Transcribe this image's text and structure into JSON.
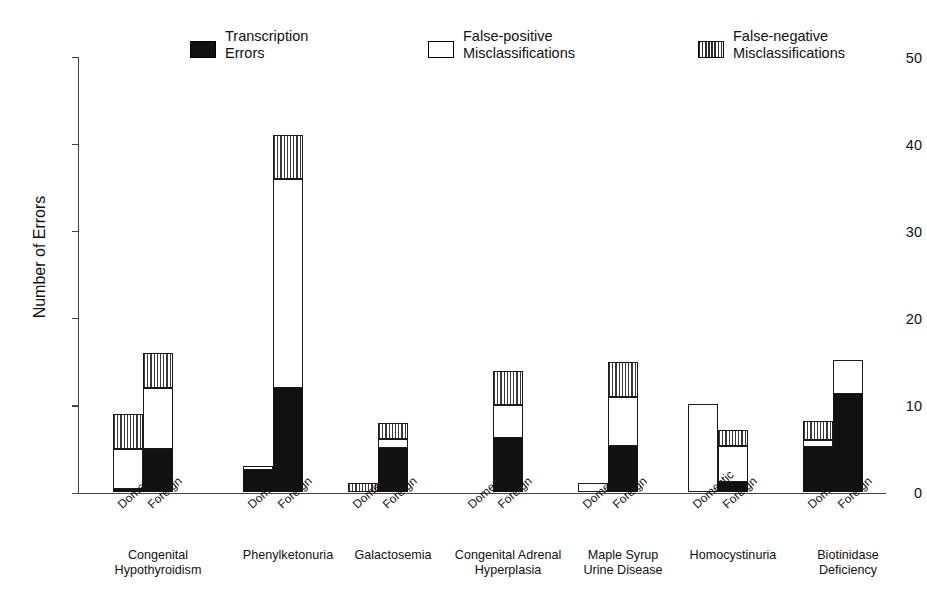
{
  "chart_data": {
    "type": "bar",
    "title": "",
    "xlabel": "",
    "ylabel": "Number of Errors",
    "ylim": [
      0,
      50
    ],
    "yticks": [
      0,
      10,
      20,
      30,
      40,
      50
    ],
    "grid": false,
    "stacked": true,
    "legend_position": "top",
    "categories": [
      "Congenital\nHypothyroidism",
      "Phenylketonuria",
      "Galactosemia",
      "Congenital Adrenal\nHyperplasia",
      "Maple Syrup\nUrine Disease",
      "Homocystinuria",
      "Biotinidase\nDeficiency"
    ],
    "subcategories": [
      "Domestic",
      "Foreign"
    ],
    "series": [
      {
        "name": "Transcription Errors",
        "fill": "black",
        "values": {
          "Domestic": [
            0.4,
            2.6,
            0,
            0,
            0,
            0,
            5.2
          ],
          "Foreign": [
            5.0,
            12.0,
            5.1,
            6.3,
            5.3,
            1.2,
            11.3
          ]
        }
      },
      {
        "name": "False-positive Misclassifications",
        "fill": "white",
        "values": {
          "Domestic": [
            4.6,
            0.5,
            0,
            0,
            1.1,
            10.2,
            0.8
          ],
          "Foreign": [
            7.0,
            24.0,
            1.0,
            3.7,
            5.7,
            4.1,
            3.9
          ]
        }
      },
      {
        "name": "False-negative Misclassifications",
        "fill": "hatch",
        "values": {
          "Domestic": [
            4.0,
            0,
            1.1,
            0,
            0,
            0,
            2.2
          ],
          "Foreign": [
            4.0,
            5.0,
            1.9,
            4.0,
            4.0,
            1.9,
            0
          ]
        }
      }
    ],
    "totals": {
      "Domestic": [
        9.0,
        3.1,
        1.1,
        0,
        1.1,
        10.2,
        8.2
      ],
      "Foreign": [
        16.0,
        41.0,
        8.0,
        14.0,
        15.0,
        7.2,
        15.2
      ]
    }
  },
  "legend": {
    "items": [
      {
        "label": "Transcription\nErrors",
        "swatch": "black"
      },
      {
        "label": "False-positive\nMisclassifications",
        "swatch": "white"
      },
      {
        "label": "False-negative\nMisclassifications",
        "swatch": "hatch"
      }
    ]
  },
  "axis": {
    "y_title": "Number of Errors",
    "y_tick_labels": [
      "50",
      "40",
      "30",
      "20",
      "10",
      "0"
    ]
  }
}
